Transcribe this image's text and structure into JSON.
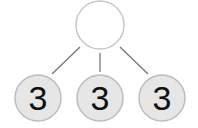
{
  "diagram": {
    "type": "tree",
    "root": {
      "label": "",
      "fill": "#ffffff",
      "stroke": "#c8c8c8"
    },
    "children": [
      {
        "label": "3",
        "fill": "#e6e6e6",
        "stroke": "#bdbdbd"
      },
      {
        "label": "3",
        "fill": "#e6e6e6",
        "stroke": "#bdbdbd"
      },
      {
        "label": "3",
        "fill": "#e6e6e6",
        "stroke": "#bdbdbd"
      }
    ],
    "edge_color": "#777777"
  }
}
